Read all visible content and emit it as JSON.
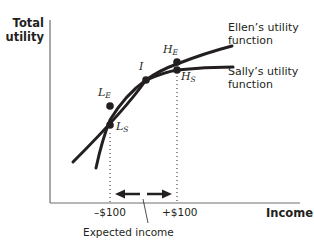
{
  "diagram": {
    "axes": {
      "y_label_line1": "Total",
      "y_label_line2": "utility",
      "x_label": "Income"
    },
    "ticks": {
      "low": "–$100",
      "high": "+$100"
    },
    "annotation": "Expected income",
    "curves": [
      {
        "name": "ellen",
        "label_line1": "Ellen’s utility",
        "label_line2": "function",
        "color": "#231f20"
      },
      {
        "name": "sally",
        "label_line1": "Sally’s utility",
        "label_line2": "function",
        "color": "#231f20"
      }
    ],
    "points": {
      "I": {
        "main": "I",
        "sub": ""
      },
      "LE": {
        "main": "L",
        "sub": "E"
      },
      "LS": {
        "main": "L",
        "sub": "S"
      },
      "HE": {
        "main": "H",
        "sub": "E"
      },
      "HS": {
        "main": "H",
        "sub": "S"
      }
    },
    "colors": {
      "ink": "#231f20",
      "axis": "#6d6e71"
    }
  }
}
